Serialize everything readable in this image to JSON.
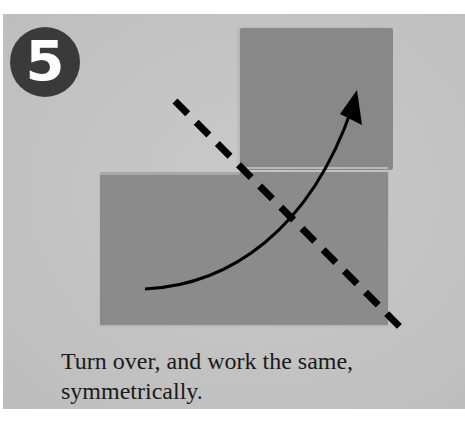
{
  "step": {
    "number": "5"
  },
  "instruction": {
    "line1": "Turn over, and work the same,",
    "line2": "symmetrically."
  },
  "diagram": {
    "fold_line": "valley-fold-dashed",
    "arrow": "fold-direction-arrow",
    "colors": {
      "background": "#c4c4c4",
      "paper": "#8a8a8a",
      "lines": "#000000",
      "badge": "#3a3a3a"
    }
  }
}
